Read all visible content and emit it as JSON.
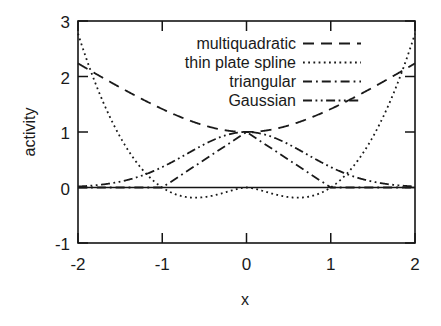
{
  "chart_data": {
    "type": "line",
    "title": "",
    "xlabel": "x",
    "ylabel": "activity",
    "xlim": [
      -2,
      2
    ],
    "ylim": [
      -1,
      3
    ],
    "xticks": [
      -2,
      -1,
      0,
      1,
      2
    ],
    "xtick_labels": [
      "-2",
      "-1",
      "0",
      "1",
      "2"
    ],
    "yticks": [
      -1,
      0,
      1,
      2,
      3
    ],
    "ytick_labels": [
      "-1",
      "0",
      "1",
      "2",
      "3"
    ],
    "grid": false,
    "legend_position": "top-center",
    "series": [
      {
        "name": "multiquadratic",
        "style": "dashed",
        "formula": "sqrt(1 + x^2)",
        "x": [
          -2,
          -1.75,
          -1.5,
          -1.25,
          -1,
          -0.75,
          -0.5,
          -0.25,
          0,
          0.25,
          0.5,
          0.75,
          1,
          1.25,
          1.5,
          1.75,
          2
        ],
        "values": [
          2.236,
          2.016,
          1.803,
          1.601,
          1.414,
          1.25,
          1.118,
          1.031,
          1.0,
          1.031,
          1.118,
          1.25,
          1.414,
          1.601,
          1.803,
          2.016,
          2.236
        ]
      },
      {
        "name": "thin plate spline",
        "style": "dotted",
        "formula": "x^2 * ln(|x|)",
        "x": [
          -2,
          -1.75,
          -1.5,
          -1.25,
          -1,
          -0.75,
          -0.6,
          -0.5,
          -0.25,
          -0.1,
          0,
          0.1,
          0.25,
          0.5,
          0.6,
          0.75,
          1,
          1.25,
          1.5,
          1.75,
          2
        ],
        "values": [
          2.773,
          2.714,
          1.824,
          0.697,
          0.0,
          -0.162,
          -0.184,
          -0.173,
          -0.087,
          -0.023,
          0.0,
          -0.023,
          -0.087,
          -0.173,
          -0.184,
          -0.162,
          0.0,
          0.697,
          1.824,
          2.714,
          2.773
        ]
      },
      {
        "name": "triangular",
        "style": "dash-dot",
        "formula": "max(0, 1 - |x|)",
        "x": [
          -2,
          -1,
          0,
          1,
          2
        ],
        "values": [
          0,
          0,
          1,
          0,
          0
        ]
      },
      {
        "name": "Gaussian",
        "style": "dash-dot-dot",
        "formula": "exp(-x^2)",
        "x": [
          -2,
          -1.75,
          -1.5,
          -1.25,
          -1,
          -0.75,
          -0.5,
          -0.25,
          0,
          0.25,
          0.5,
          0.75,
          1,
          1.25,
          1.5,
          1.75,
          2
        ],
        "values": [
          0.018,
          0.046,
          0.105,
          0.21,
          0.368,
          0.57,
          0.779,
          0.939,
          1.0,
          0.939,
          0.779,
          0.57,
          0.368,
          0.21,
          0.105,
          0.046,
          0.018
        ]
      }
    ]
  },
  "legend": {
    "entries": [
      {
        "label": "multiquadratic",
        "style": "dashed"
      },
      {
        "label": "thin plate spline",
        "style": "dotted"
      },
      {
        "label": "triangular",
        "style": "dash-dot"
      },
      {
        "label": "Gaussian",
        "style": "dash-dot-dot"
      }
    ]
  },
  "axes": {
    "x_label": "x",
    "y_label": "activity",
    "x_tick_labels": [
      "-2",
      "-1",
      "0",
      "1",
      "2"
    ],
    "y_tick_labels": [
      "3",
      "2",
      "1",
      "0",
      "-1"
    ]
  },
  "colors": {
    "ink": "#1a1a1a",
    "background": "#ffffff"
  }
}
